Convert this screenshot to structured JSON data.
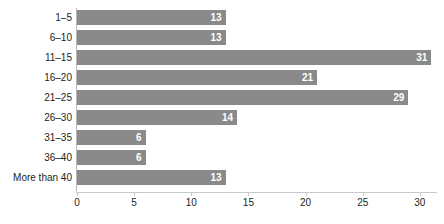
{
  "chart_data": {
    "type": "bar",
    "orientation": "horizontal",
    "title": "",
    "xlabel": "",
    "ylabel": "",
    "categories": [
      "1–5",
      "6–10",
      "11–15",
      "16–20",
      "21–25",
      "26–30",
      "31–35",
      "36–40",
      "More than 40"
    ],
    "values": [
      13,
      13,
      31,
      21,
      29,
      14,
      6,
      6,
      13
    ],
    "value_labels": [
      "13",
      "13",
      "31",
      "21",
      "29",
      "14",
      "6",
      "6",
      "13"
    ],
    "xlim": [
      0,
      31.5
    ],
    "xticks": [
      0,
      5,
      10,
      15,
      20,
      25,
      30
    ],
    "xtick_labels": [
      "0",
      "5",
      "10",
      "15",
      "20",
      "25",
      "30"
    ],
    "grid": false,
    "legend": null,
    "bar_color": "#8a8a8a",
    "value_label_color": "#ffffff",
    "axis_color": "#c9c9c9",
    "text_color": "#231f20",
    "background": "#ffffff"
  }
}
